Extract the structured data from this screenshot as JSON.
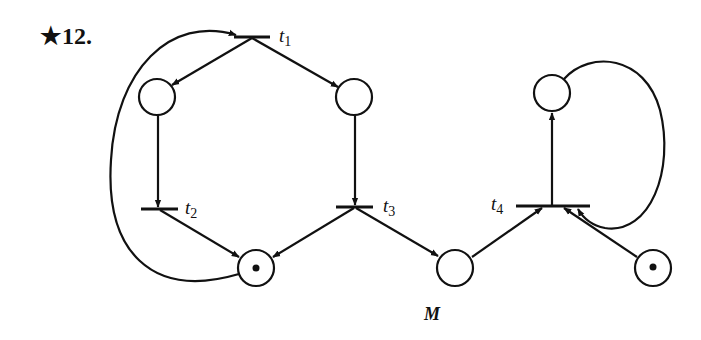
{
  "problem": {
    "number": "★12."
  },
  "caption": "M",
  "colors": {
    "ink": "#111111",
    "background": "#ffffff"
  },
  "transitions": [
    {
      "id": "t1",
      "label": "t",
      "sub": "1"
    },
    {
      "id": "t2",
      "label": "t",
      "sub": "2"
    },
    {
      "id": "t3",
      "label": "t",
      "sub": "3"
    },
    {
      "id": "t4",
      "label": "t",
      "sub": "4"
    }
  ],
  "places": [
    {
      "id": "p-top-left",
      "tokens": 0
    },
    {
      "id": "p-top-middle",
      "tokens": 0
    },
    {
      "id": "p-bottom-left",
      "tokens": 1
    },
    {
      "id": "p-bottom-middle",
      "tokens": 0
    },
    {
      "id": "p-top-right",
      "tokens": 0
    },
    {
      "id": "p-bottom-right",
      "tokens": 1
    }
  ]
}
